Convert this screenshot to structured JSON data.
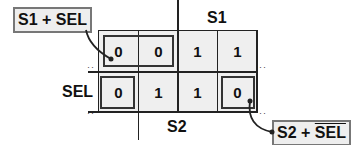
{
  "kmap": {
    "col_var": "S1",
    "col_var2": "S2",
    "row_var": "SEL",
    "rows": [
      [
        "0",
        "0",
        "1",
        "1"
      ],
      [
        "0",
        "1",
        "1",
        "0"
      ]
    ]
  },
  "callouts": {
    "top_left": {
      "part1": "S1",
      "op": " + ",
      "part2": "SEL"
    },
    "bottom_right": {
      "part1": "S2",
      "op": " + ",
      "part2": "SEL",
      "part2_overlined": true
    }
  },
  "colors": {
    "cell_bg": "#efefef",
    "line": "#222222",
    "callout_border": "#777777"
  }
}
